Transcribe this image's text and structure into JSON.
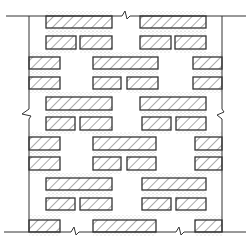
{
  "diagram": {
    "title": "Perforated brick wall elevation (hollow/lattice bond)",
    "colors": {
      "background": "#ffffff",
      "line": "#333333",
      "hatch": "#555555",
      "mortar_dots": "#9a9a9a"
    },
    "boundary": {
      "top_y": 16,
      "bottom_y": 232,
      "left_x": 29,
      "right_x": 222,
      "top_line": [
        6,
        246
      ],
      "bottom_line": [
        4,
        246
      ],
      "break_marks": [
        {
          "edge": "top",
          "x": 126
        },
        {
          "edge": "bottom",
          "x": 75
        },
        {
          "edge": "bottom",
          "x": 180
        },
        {
          "edge": "left",
          "y": 113
        },
        {
          "edge": "right",
          "y": 113
        }
      ]
    },
    "bricks": [
      {
        "row": 1,
        "y": 16,
        "h": 12,
        "x": [
          [
            46,
            112
          ],
          [
            140,
            206
          ]
        ]
      },
      {
        "row": 2,
        "y": 36,
        "h": 13,
        "x": [
          [
            46,
            76
          ],
          [
            80,
            112
          ],
          [
            140,
            171
          ],
          [
            175,
            206
          ]
        ]
      },
      {
        "row": 3,
        "y": 57,
        "h": 12,
        "x": [
          [
            29,
            60
          ],
          [
            93,
            158
          ],
          [
            193,
            222
          ]
        ]
      },
      {
        "row": 4,
        "y": 77,
        "h": 12,
        "x": [
          [
            29,
            60
          ],
          [
            93,
            121
          ],
          [
            127,
            158
          ],
          [
            193,
            222
          ]
        ]
      },
      {
        "row": 5,
        "y": 97,
        "h": 13,
        "x": [
          [
            46,
            112
          ],
          [
            140,
            206
          ]
        ]
      },
      {
        "row": 6,
        "y": 117,
        "h": 13,
        "x": [
          [
            46,
            75
          ],
          [
            80,
            112
          ],
          [
            142,
            171
          ],
          [
            176,
            206
          ]
        ]
      },
      {
        "row": 7,
        "y": 137,
        "h": 13,
        "x": [
          [
            29,
            60
          ],
          [
            93,
            156
          ],
          [
            195,
            222
          ]
        ]
      },
      {
        "row": 8,
        "y": 157,
        "h": 13,
        "x": [
          [
            29,
            60
          ],
          [
            93,
            121
          ],
          [
            127,
            156
          ],
          [
            195,
            222
          ]
        ]
      },
      {
        "row": 9,
        "y": 178,
        "h": 12,
        "x": [
          [
            46,
            112
          ],
          [
            142,
            206
          ]
        ]
      },
      {
        "row": 10,
        "y": 198,
        "h": 12,
        "x": [
          [
            46,
            75
          ],
          [
            80,
            112
          ],
          [
            142,
            171
          ],
          [
            176,
            206
          ]
        ]
      },
      {
        "row": 11,
        "y": 220,
        "h": 12,
        "x": [
          [
            29,
            60
          ],
          [
            93,
            156
          ],
          [
            195,
            222
          ]
        ]
      }
    ]
  }
}
